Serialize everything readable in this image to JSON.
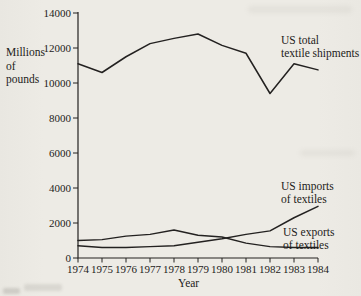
{
  "figure": {
    "kind": "scanned-textbook-line-chart"
  },
  "chart_data": {
    "type": "line",
    "title": "",
    "xlabel": "Year",
    "ylabel": "Millions of pounds",
    "ylabel_lines": [
      "Millions",
      "of",
      "pounds"
    ],
    "x": [
      1974,
      1975,
      1976,
      1977,
      1978,
      1979,
      1980,
      1981,
      1982,
      1983,
      1984
    ],
    "y_ticks": [
      0,
      2000,
      4000,
      6000,
      8000,
      10000,
      12000,
      14000
    ],
    "ylim": [
      0,
      14000
    ],
    "grid": false,
    "legend_position": "inline-annotations",
    "series": [
      {
        "name": "US total textile shipments",
        "label_lines": [
          "US total",
          "textile shipments"
        ],
        "values": [
          11100,
          10600,
          11500,
          12250,
          12550,
          12800,
          12150,
          11700,
          9400,
          11100,
          10750
        ]
      },
      {
        "name": "US imports of textiles",
        "label_lines": [
          "US imports",
          "of textiles"
        ],
        "values": [
          700,
          600,
          600,
          650,
          700,
          900,
          1100,
          1350,
          1550,
          2300,
          2950
        ]
      },
      {
        "name": "US exports of textiles",
        "label_lines": [
          "US exports",
          "of textiles"
        ],
        "values": [
          1000,
          1050,
          1250,
          1350,
          1600,
          1300,
          1200,
          850,
          650,
          600,
          600
        ]
      }
    ]
  }
}
